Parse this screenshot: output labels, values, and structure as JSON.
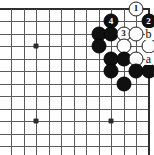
{
  "diagram": {
    "kind": "go-board-diagram",
    "board": {
      "cols": 12,
      "rows": 12,
      "origin_x": 11,
      "origin_y": 8.5,
      "spacing": 12.5,
      "grid_color": "#5a5a5a",
      "border_color": "#2e2e2e",
      "background_color": "#ffffff",
      "top_is_edge": true,
      "right_is_edge": true,
      "left_is_cut": true,
      "bottom_is_cut": true
    },
    "star_points": [
      {
        "name": "star-point-left-upper",
        "col": 2,
        "row": 3
      },
      {
        "name": "star-point-left-lower",
        "col": 2,
        "row": 9
      },
      {
        "name": "star-point-center-lower",
        "col": 8,
        "row": 9
      }
    ],
    "stones": [
      {
        "name": "white-stone-move-1",
        "color": "white",
        "col": 10,
        "row": 0,
        "number": "1"
      },
      {
        "name": "black-stone-move-2",
        "color": "black",
        "col": 11,
        "row": 1,
        "number": "2"
      },
      {
        "name": "black-stone-move-4",
        "color": "black",
        "col": 8,
        "row": 1,
        "number": "4"
      },
      {
        "name": "black-stone-c7r2",
        "color": "black",
        "col": 7,
        "row": 2,
        "number": ""
      },
      {
        "name": "black-stone-c8r2",
        "color": "black",
        "col": 8,
        "row": 2,
        "number": ""
      },
      {
        "name": "white-stone-move-3",
        "color": "white",
        "col": 9,
        "row": 2,
        "number": "3"
      },
      {
        "name": "white-stone-c10r2",
        "color": "white",
        "col": 10,
        "row": 2,
        "number": ""
      },
      {
        "name": "black-stone-c7r3",
        "color": "black",
        "col": 7,
        "row": 3,
        "number": ""
      },
      {
        "name": "white-stone-c9r3",
        "color": "white",
        "col": 9,
        "row": 3,
        "number": ""
      },
      {
        "name": "white-stone-c11r3",
        "color": "white",
        "col": 11,
        "row": 3,
        "number": ""
      },
      {
        "name": "black-stone-c8r4",
        "color": "black",
        "col": 8,
        "row": 4,
        "number": ""
      },
      {
        "name": "black-stone-c9r4",
        "color": "black",
        "col": 9,
        "row": 4,
        "number": ""
      },
      {
        "name": "white-stone-c10r4",
        "color": "white",
        "col": 10,
        "row": 4,
        "number": ""
      },
      {
        "name": "black-stone-c8r5",
        "color": "black",
        "col": 8,
        "row": 5,
        "number": ""
      },
      {
        "name": "black-stone-c10r5",
        "color": "black",
        "col": 10,
        "row": 5,
        "number": ""
      },
      {
        "name": "black-stone-c11r5",
        "color": "black",
        "col": 11,
        "row": 5,
        "number": ""
      },
      {
        "name": "black-stone-c9r6",
        "color": "black",
        "col": 9,
        "row": 6,
        "number": ""
      }
    ],
    "point_labels": [
      {
        "name": "point-label-b",
        "text": "b",
        "col": 11,
        "row": 2
      },
      {
        "name": "point-label-a",
        "text": "a",
        "col": 11,
        "row": 4
      }
    ]
  }
}
